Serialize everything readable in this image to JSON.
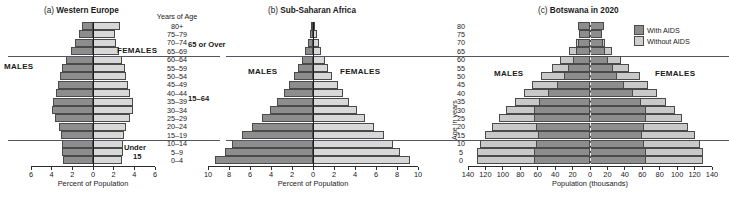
{
  "figure": {
    "age_column_header": "Years of Age",
    "age_groups": [
      "80+",
      "75–79",
      "70–74",
      "65–69",
      "60–64",
      "55–59",
      "50–54",
      "45–49",
      "40–44",
      "35–39",
      "30–34",
      "25–29",
      "20–24",
      "15–19",
      "10–14",
      "5–9",
      "0–4"
    ],
    "group_labels": {
      "over65": "65 or Over",
      "working": "15–64",
      "under15_line1": "Under",
      "under15_line2": "15"
    },
    "males_label": "MALES",
    "females_label": "FEMALES",
    "age_axis_title": "Age in years",
    "age_axis_ticks": [
      "80",
      "75",
      "70",
      "65",
      "60",
      "55",
      "50",
      "45",
      "40",
      "35",
      "30",
      "25",
      "20",
      "15",
      "10",
      "5",
      "0"
    ],
    "legend": {
      "items": [
        {
          "label": "With AIDS",
          "swatch": "dark",
          "color": "#8d8d8d"
        },
        {
          "label": "Without AIDS",
          "swatch": "light",
          "color": "#cfcfcf"
        }
      ]
    },
    "colors": {
      "males": "#8d8d8d",
      "females": "#d8d8d8",
      "with_aids": "#8d8d8d",
      "without_aids": "#c9c9c9",
      "outline": "#4a4a4a",
      "axis": "#2b2b2b"
    }
  },
  "chart_data": [
    {
      "type": "bar",
      "panel": "a",
      "title": "(a) Western Europe",
      "title_prefix": "(a)",
      "title_text": "Western Europe",
      "xlabel": "Percent of Population",
      "ylabel": "Years of Age",
      "xlim": [
        -6,
        6
      ],
      "xticks": [
        6,
        4,
        2,
        0,
        2,
        4,
        6
      ],
      "xtick_values": [
        -6,
        -4,
        -2,
        0,
        2,
        4,
        6
      ],
      "grid": false,
      "categories": [
        "80+",
        "75–79",
        "70–74",
        "65–69",
        "60–64",
        "55–59",
        "50–54",
        "45–49",
        "40–44",
        "35–39",
        "30–34",
        "25–29",
        "20–24",
        "15–19",
        "10–14",
        "5–9",
        "0–4"
      ],
      "series": [
        {
          "name": "MALES",
          "values": [
            1.1,
            1.4,
            1.7,
            2.1,
            2.6,
            3.0,
            3.2,
            3.4,
            3.6,
            3.9,
            4.0,
            3.7,
            3.3,
            3.1,
            3.0,
            3.0,
            2.9
          ]
        },
        {
          "name": "FEMALES",
          "values": [
            2.6,
            2.1,
            2.2,
            2.5,
            2.8,
            3.1,
            3.2,
            3.4,
            3.6,
            3.9,
            3.9,
            3.6,
            3.2,
            3.0,
            2.9,
            2.9,
            2.8
          ]
        }
      ]
    },
    {
      "type": "bar",
      "panel": "b",
      "title": "(b) Sub-Saharan Africa",
      "title_prefix": "(b)",
      "title_text": "Sub-Saharan Africa",
      "xlabel": "Percent of Population",
      "ylabel": "Age in years",
      "xlim": [
        -10,
        10
      ],
      "xticks": [
        10,
        8,
        6,
        4,
        2,
        0,
        2,
        4,
        6,
        8,
        10
      ],
      "xtick_values": [
        -10,
        -8,
        -6,
        -4,
        -2,
        0,
        2,
        4,
        6,
        8,
        10
      ],
      "grid": false,
      "categories": [
        "80+",
        "75–79",
        "70–74",
        "65–69",
        "60–64",
        "55–59",
        "50–54",
        "45–49",
        "40–44",
        "35–39",
        "30–34",
        "25–29",
        "20–24",
        "15–19",
        "10–14",
        "5–9",
        "0–4"
      ],
      "series": [
        {
          "name": "MALES",
          "values": [
            0.15,
            0.3,
            0.5,
            0.75,
            1.05,
            1.4,
            1.8,
            2.3,
            2.8,
            3.4,
            4.1,
            4.9,
            5.8,
            6.8,
            7.7,
            8.4,
            9.3
          ]
        },
        {
          "name": "FEMALES",
          "values": [
            0.2,
            0.35,
            0.55,
            0.8,
            1.1,
            1.45,
            1.85,
            2.35,
            2.85,
            3.45,
            4.15,
            4.95,
            5.85,
            6.8,
            7.6,
            8.3,
            9.2
          ]
        }
      ]
    },
    {
      "type": "bar",
      "panel": "c",
      "title": "(c) Botswana in 2020",
      "title_prefix": "(c)",
      "title_text": "Botswana in 2020",
      "xlabel": "Population (thousands)",
      "ylabel": "Age in years",
      "xlim": [
        -140,
        140
      ],
      "xticks": [
        140,
        120,
        100,
        80,
        60,
        40,
        20,
        0,
        20,
        40,
        60,
        80,
        100,
        120,
        140
      ],
      "xtick_values": [
        -140,
        -120,
        -100,
        -80,
        -60,
        -40,
        -20,
        0,
        20,
        40,
        60,
        80,
        100,
        120,
        140
      ],
      "grid": false,
      "categories": [
        "80+",
        "75–79",
        "70–74",
        "65–69",
        "60–64",
        "55–59",
        "50–54",
        "45–49",
        "40–44",
        "35–39",
        "30–34",
        "25–29",
        "20–24",
        "15–19",
        "10–14",
        "5–9",
        "0–4"
      ],
      "series": [
        {
          "name": "MALES With AIDS",
          "values": [
            14,
            13,
            14,
            16,
            20,
            25,
            30,
            38,
            48,
            58,
            64,
            64,
            62,
            60,
            62,
            64,
            64
          ]
        },
        {
          "name": "MALES Without AIDS",
          "values": [
            6,
            10,
            16,
            24,
            34,
            44,
            56,
            66,
            76,
            86,
            96,
            104,
            112,
            120,
            126,
            130,
            130
          ]
        },
        {
          "name": "FEMALES With AIDS",
          "values": [
            16,
            14,
            15,
            17,
            21,
            26,
            31,
            39,
            49,
            58,
            64,
            64,
            62,
            60,
            62,
            64,
            64
          ]
        },
        {
          "name": "FEMALES Without AIDS",
          "values": [
            7,
            11,
            17,
            25,
            35,
            45,
            57,
            67,
            77,
            87,
            97,
            105,
            113,
            120,
            126,
            130,
            130
          ]
        }
      ]
    }
  ]
}
